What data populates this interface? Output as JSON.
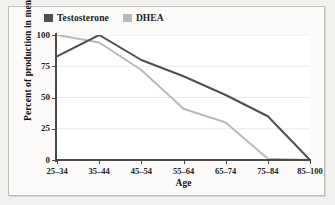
{
  "chart_data": {
    "type": "line",
    "title": "",
    "xlabel": "Age",
    "ylabel": "Percent of production in men",
    "categories": [
      "25–34",
      "35–44",
      "45–54",
      "55–64",
      "65–74",
      "75–84",
      "85–100"
    ],
    "yticks": [
      "0",
      "25",
      "50",
      "75",
      "100"
    ],
    "ylim": [
      0,
      100
    ],
    "grid": "horizontal",
    "legend_position": "top-left",
    "series": [
      {
        "name": "Testosterone",
        "color": "#4e4e56",
        "values": [
          83,
          100,
          80,
          67,
          52,
          35,
          0
        ]
      },
      {
        "name": "DHEA",
        "color": "#b9b9b9",
        "values": [
          100,
          94,
          72,
          41,
          30,
          1,
          0
        ]
      }
    ]
  },
  "legend": {
    "entries": [
      {
        "label": "Testosterone",
        "swatch_name": "legend-swatch-testosterone"
      },
      {
        "label": "DHEA",
        "swatch_name": "legend-swatch-dhea"
      }
    ]
  },
  "colors": {
    "page_background": "#f2f1ef",
    "panel_background": "#fbfaf9",
    "plot_background": "#ffffff",
    "border": "#bdbcb9",
    "axis": "#4a4a4a",
    "gridline": "#e8e8e8",
    "text": "#1d1d1d"
  }
}
